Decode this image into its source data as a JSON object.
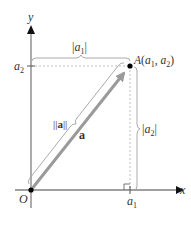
{
  "diagram": {
    "type": "vector-in-plane",
    "axes": {
      "x_label": "x",
      "y_label": "y",
      "origin_label": "O"
    },
    "point": {
      "label_name": "A",
      "label_coords": "(a",
      "sub1": "1",
      "comma": ", a",
      "sub2": "2",
      "close": ")"
    },
    "ticks": {
      "x_tick": "a",
      "x_tick_sub": "1",
      "y_tick": "a",
      "y_tick_sub": "2"
    },
    "braces": {
      "horizontal_left": "|a",
      "horizontal_sub": "1",
      "horizontal_right": "|",
      "vertical_left": "|a",
      "vertical_sub": "2",
      "vertical_right": "|",
      "norm_label": "||a||"
    },
    "vector_label": "a",
    "colors": {
      "axis": "#808080",
      "vector": "#9a9a9a",
      "dashed": "#b0b0b0",
      "brace": "#a0a0a0",
      "point": "#000000",
      "text": "#333333"
    }
  }
}
